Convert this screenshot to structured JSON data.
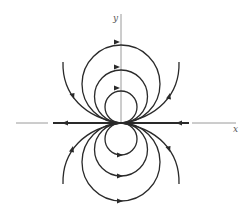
{
  "figure": {
    "type": "phase-portrait",
    "axes": {
      "x_label": "x",
      "y_label": "y"
    },
    "colors": {
      "curve": "#2a2a2a",
      "axis": "#9a9a9a",
      "background": "#ffffff"
    },
    "upper_loops": {
      "count": 3,
      "arrow_direction": "right"
    },
    "lower_loops": {
      "count": 3,
      "arrow_direction": "right"
    },
    "outer_arcs": {
      "count": 4
    },
    "x_axis_flow": "toward origin from right, away from origin to left"
  }
}
